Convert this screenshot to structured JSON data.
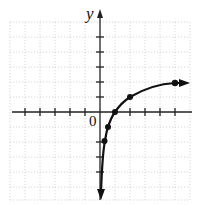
{
  "graph": {
    "axis_labels": {
      "y": "y",
      "origin": "0"
    },
    "grid": {
      "x_min": -6,
      "x_max": 6,
      "y_min": -6,
      "y_max": 6,
      "spacing_px": 15
    },
    "points": [
      {
        "x": 0.25,
        "y": -2
      },
      {
        "x": 0.5,
        "y": -1
      },
      {
        "x": 1,
        "y": 0
      },
      {
        "x": 2,
        "y": 1
      },
      {
        "x": 5,
        "y": 2
      }
    ],
    "curve": "increasing, vertical asymptote at x=0, arrows at both ends",
    "colors": {
      "curve": "#111111",
      "grid": "#bbbbbb",
      "axis": "#222222"
    }
  }
}
